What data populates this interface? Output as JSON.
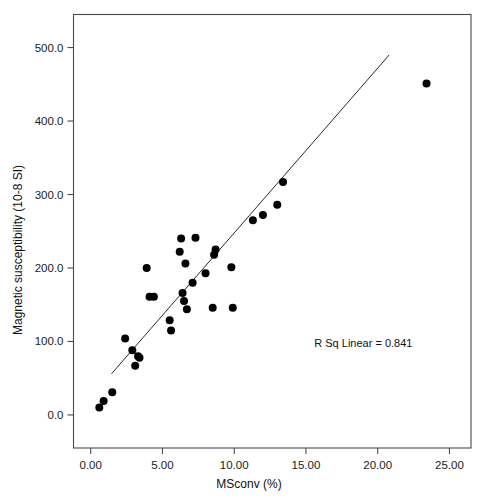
{
  "chart_data": {
    "type": "scatter",
    "title": "",
    "subtitle": "",
    "xlabel": "MSconv (%)",
    "ylabel": "Magnetic susceptibility (10-8 SI)",
    "xlim": [
      -1.2,
      26.5
    ],
    "ylim": [
      -45.0,
      545.0
    ],
    "grid": false,
    "legend": null,
    "x_ticks": [
      0.0,
      5.0,
      10.0,
      15.0,
      20.0,
      25.0
    ],
    "x_tick_labels": [
      "0.00",
      "5.00",
      "10.00",
      "15.00",
      "20.00",
      "25.00"
    ],
    "y_ticks": [
      0.0,
      100.0,
      200.0,
      300.0,
      400.0,
      500.0
    ],
    "y_tick_labels": [
      "0.0",
      "100.0",
      "200.0",
      "300.0",
      "400.0",
      "500.0"
    ],
    "annotations": [
      {
        "name": "r-squared-annotation",
        "text": "R Sq Linear = 0.841",
        "x": 19.0,
        "y": 92.0
      }
    ],
    "series": [
      {
        "name": "samples",
        "marker": "filled-circle",
        "color": "#000000",
        "points": [
          [
            0.6,
            10
          ],
          [
            0.9,
            19
          ],
          [
            1.5,
            31
          ],
          [
            2.4,
            104
          ],
          [
            2.9,
            88
          ],
          [
            3.1,
            67
          ],
          [
            3.3,
            80
          ],
          [
            3.4,
            78
          ],
          [
            3.9,
            200
          ],
          [
            4.1,
            161
          ],
          [
            4.4,
            161
          ],
          [
            5.5,
            129
          ],
          [
            5.6,
            115
          ],
          [
            6.2,
            222
          ],
          [
            6.3,
            240
          ],
          [
            6.4,
            166
          ],
          [
            6.5,
            155
          ],
          [
            6.6,
            206
          ],
          [
            6.7,
            144
          ],
          [
            7.1,
            180
          ],
          [
            7.3,
            241
          ],
          [
            8.0,
            193
          ],
          [
            8.5,
            146
          ],
          [
            8.6,
            218
          ],
          [
            8.7,
            225
          ],
          [
            9.8,
            201
          ],
          [
            9.9,
            146
          ],
          [
            11.3,
            265
          ],
          [
            12.0,
            272
          ],
          [
            13.0,
            286
          ],
          [
            13.4,
            317
          ],
          [
            23.4,
            451
          ]
        ]
      }
    ],
    "fit_line": {
      "name": "linear-fit-line",
      "type": "linear",
      "r_squared": 0.841,
      "x_start": 1.45,
      "y_start": 56,
      "x_end": 20.8,
      "y_end": 490
    }
  }
}
